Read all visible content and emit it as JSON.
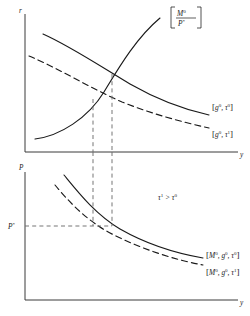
{
  "figure": {
    "title": "",
    "panels": [
      {
        "id": "top-panel",
        "name": "money-market-goods-market-panel",
        "y_axis_label": "r",
        "x_axis_label": "y",
        "curves": [
          {
            "name": "ls-curve-upward",
            "style": "solid",
            "slope": "upward",
            "label": "[M0/P*]",
            "label_numerator": "M",
            "label_numerator_sup": "0",
            "label_denominator": "P",
            "label_denominator_sup": "*"
          },
          {
            "name": "is-curve-baseline",
            "style": "solid",
            "slope": "downward",
            "label": "[g0, τ0]",
            "label_open": "[",
            "label_g": "g",
            "label_g_sup": "0",
            "label_comma": ", ",
            "label_tau": "τ",
            "label_tau_sup": "0",
            "label_close": "]"
          },
          {
            "name": "is-curve-shifted",
            "style": "dashed",
            "slope": "downward",
            "label": "[g0, τ1]",
            "label_open": "[",
            "label_g": "g",
            "label_g_sup": "0",
            "label_comma": ", ",
            "label_tau": "τ",
            "label_tau_sup": "1",
            "label_close": "]"
          }
        ],
        "equilibria": [
          {
            "name": "equilibrium-baseline",
            "x": 112,
            "y": 74
          },
          {
            "name": "equilibrium-shifted",
            "x": 93,
            "y": 99
          }
        ]
      },
      {
        "id": "bottom-panel",
        "name": "aggregate-demand-panel",
        "y_axis_label": "P",
        "x_axis_label": "y",
        "y_tick_label": "P",
        "y_tick_label_sup": "*",
        "annotation": "τ1 > τ0",
        "annotation_lhs": "τ",
        "annotation_lhs_sup": "1",
        "annotation_op": " > ",
        "annotation_rhs": "τ",
        "annotation_rhs_sup": "0",
        "curves": [
          {
            "name": "ad-curve-baseline",
            "style": "solid",
            "label": "[M0, g0, τ0]",
            "label_open": "[",
            "label_m": "M",
            "label_m_sup": "0",
            "label_comma1": ", ",
            "label_g": "g",
            "label_g_sup": "0",
            "label_comma2": ", ",
            "label_tau": "τ",
            "label_tau_sup": "0",
            "label_close": "]"
          },
          {
            "name": "ad-curve-shifted",
            "style": "dashed",
            "label": "[M0, g0, τ1]",
            "label_open": "[",
            "label_m": "M",
            "label_m_sup": "0",
            "label_comma1": ", ",
            "label_g": "g",
            "label_g_sup": "0",
            "label_comma2": ", ",
            "label_tau": "τ",
            "label_tau_sup": "1",
            "label_close": "]"
          }
        ]
      }
    ],
    "guides": {
      "vertical_left_x": 93,
      "vertical_right_x": 112,
      "horizontal_y": 226
    },
    "colors": {
      "ink": "#1a1a1a",
      "axis": "#3b3b3b",
      "guide": "#6e6e6e",
      "background": "#ffffff"
    }
  }
}
